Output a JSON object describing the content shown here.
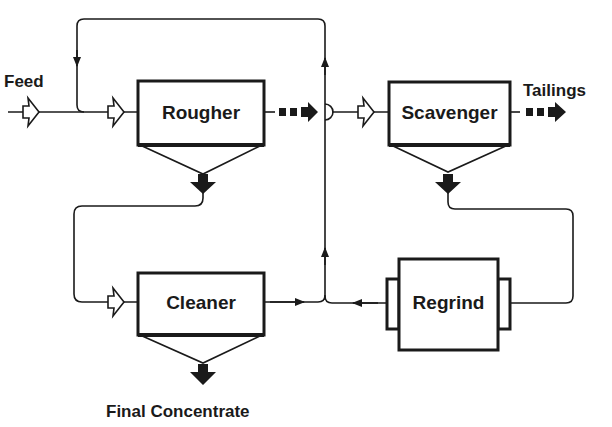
{
  "diagram": {
    "type": "flotation-circuit-flowsheet",
    "units": {
      "rougher": {
        "label": "Rougher"
      },
      "scavenger": {
        "label": "Scavenger"
      },
      "cleaner": {
        "label": "Cleaner"
      },
      "regrind": {
        "label": "Regrind"
      }
    },
    "streams": {
      "feed": {
        "label": "Feed"
      },
      "tailings": {
        "label": "Tailings"
      },
      "final_concentrate": {
        "label": "Final Concentrate"
      }
    },
    "flows": [
      {
        "from": "Feed",
        "to": "Rougher"
      },
      {
        "from": "Rougher",
        "to": "Scavenger",
        "kind": "tailings"
      },
      {
        "from": "Rougher",
        "to": "Cleaner",
        "kind": "concentrate"
      },
      {
        "from": "Scavenger",
        "to": "Tailings",
        "kind": "tailings"
      },
      {
        "from": "Scavenger",
        "to": "Regrind",
        "kind": "concentrate"
      },
      {
        "from": "Regrind",
        "to": "Rougher",
        "kind": "recycle"
      },
      {
        "from": "Cleaner",
        "to": "Rougher",
        "kind": "cleaner tailings recycle"
      },
      {
        "from": "Cleaner",
        "to": "Final Concentrate",
        "kind": "concentrate"
      }
    ],
    "colors": {
      "ink": "#1a1a1a",
      "background": "#ffffff"
    }
  }
}
